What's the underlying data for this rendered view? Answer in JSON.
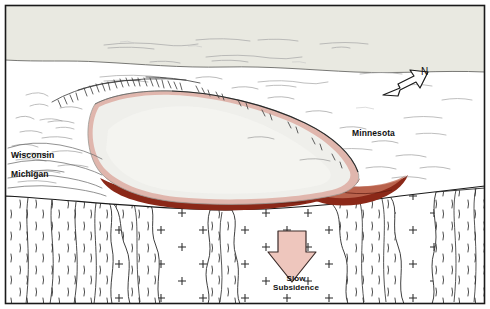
{
  "figure": {
    "type": "geologic-block-diagram",
    "frame_color": "#1a1a1a",
    "background_color": "#ffffff"
  },
  "labels": {
    "wisconsin": "Wisconsin",
    "michigan": "Michigan",
    "minnesota": "Minnesota",
    "north": "N",
    "slow_subsidence": "Slow\nSubsidence"
  },
  "icons": {
    "north_arrow": "north-arrow-icon",
    "subsidence_arrow": "down-arrow-icon"
  },
  "colors": {
    "sky_band": "#e8e8e0",
    "basin_fill": "#eeeeea",
    "basin_rim_pink": "#e3bdb4",
    "basalt_red": "#8b2818",
    "basalt_red_light": "#c06a55",
    "subsidence_arrow_fill": "#eec6bd",
    "outline": "#1a1a1a",
    "hatch_gray": "#555555",
    "cloud_gray": "#b8b8b8"
  },
  "legend_units": [
    {
      "name": "lake-sediment-basin",
      "label": "Basin fill (sedimentary rocks)",
      "fill": "#eeeeea"
    },
    {
      "name": "basalt-flows",
      "label": "Basalt lava flows",
      "fill": "#8b2818"
    },
    {
      "name": "granite-basement",
      "label": "Granitic basement (plus-sign pattern)",
      "fill": "#ffffff",
      "pattern": "plus-signs"
    },
    {
      "name": "metamorphic-basement",
      "label": "Foliated metamorphic basement (dash pattern)",
      "fill": "#ffffff",
      "pattern": "wavy-dashes"
    }
  ],
  "annotations": {
    "shoreline_hachures": "escarpment-hachure-marks",
    "clouds": "wispy-cloud-lines",
    "plus_marks": "granite-plus-symbols"
  }
}
